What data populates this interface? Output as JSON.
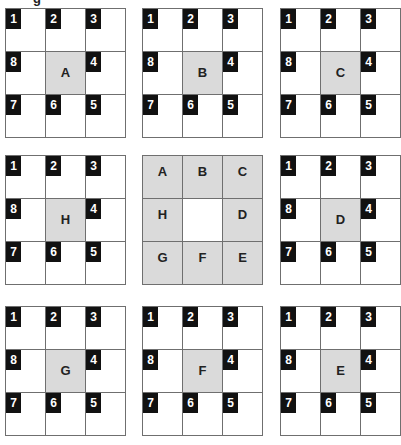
{
  "title_fragment": "g",
  "badge_layout": [
    [
      "1",
      "2",
      "3"
    ],
    [
      "8",
      null,
      "4"
    ],
    [
      "7",
      "6",
      "5"
    ]
  ],
  "colors": {
    "shaded": "#dadada",
    "badge": "#111111",
    "border": "#6f6f6f"
  },
  "panels": [
    {
      "letter": "A"
    },
    {
      "letter": "B"
    },
    {
      "letter": "C"
    },
    {
      "letter": "H"
    },
    {
      "key": true
    },
    {
      "letter": "D"
    },
    {
      "letter": "G"
    },
    {
      "letter": "F"
    },
    {
      "letter": "E"
    }
  ],
  "key_grid": [
    [
      "A",
      "B",
      "C"
    ],
    [
      "H",
      "",
      "D"
    ],
    [
      "G",
      "F",
      "E"
    ]
  ]
}
